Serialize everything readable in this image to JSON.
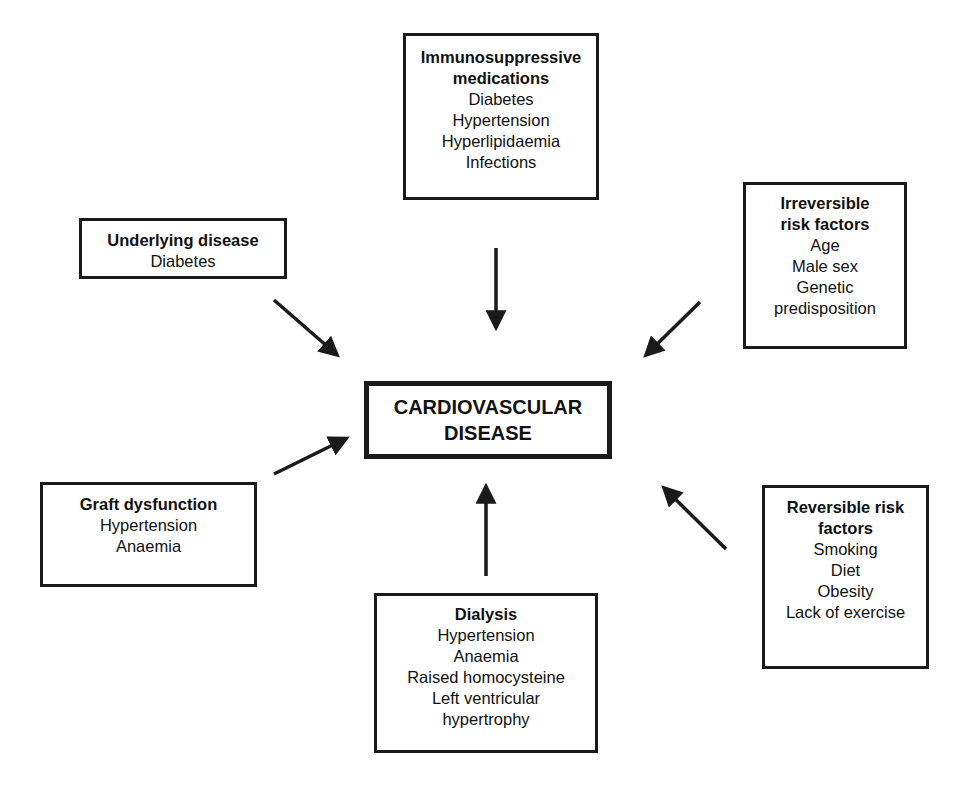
{
  "diagram": {
    "center": {
      "lines": [
        "CARDIOVASCULAR",
        "DISEASE"
      ]
    },
    "factors": [
      {
        "id": "immunosuppressive",
        "title_lines": [
          "Immunosuppressive",
          "medications"
        ],
        "items": [
          "Diabetes",
          "Hypertension",
          "Hyperlipidaemia",
          "Infections"
        ]
      },
      {
        "id": "underlying",
        "title_lines": [
          "Underlying disease"
        ],
        "items": [
          "Diabetes"
        ]
      },
      {
        "id": "irreversible",
        "title_lines": [
          "Irreversible",
          "risk factors"
        ],
        "items": [
          "Age",
          "Male sex",
          "Genetic",
          "predisposition"
        ]
      },
      {
        "id": "graft",
        "title_lines": [
          "Graft dysfunction"
        ],
        "items": [
          "Hypertension",
          "Anaemia"
        ]
      },
      {
        "id": "reversible",
        "title_lines": [
          "Reversible risk",
          "factors"
        ],
        "items": [
          "Smoking",
          "Diet",
          "Obesity",
          "Lack of exercise"
        ]
      },
      {
        "id": "dialysis",
        "title_lines": [
          "Dialysis"
        ],
        "items": [
          "Hypertension",
          "Anaemia",
          "Raised homocysteine",
          "Left ventricular",
          "hypertrophy"
        ]
      }
    ],
    "arrow_color": "#1a1a1a"
  }
}
